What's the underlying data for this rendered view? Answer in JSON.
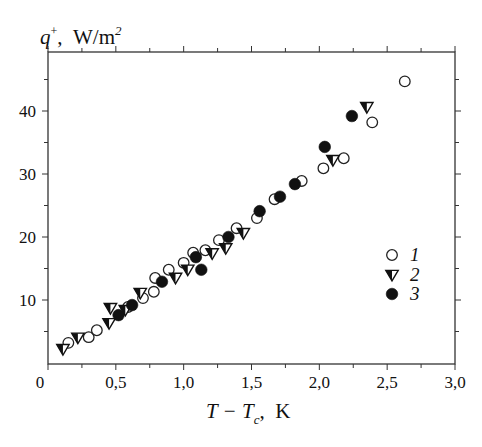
{
  "chart_data": {
    "type": "scatter",
    "title": "",
    "ylabel": {
      "main": "q",
      "sup": "+",
      "unit": "W/m",
      "unit_sup": "2"
    },
    "xlabel": {
      "main": "T − T",
      "sub": "c",
      "unit": "K"
    },
    "xlim": [
      0,
      3.0
    ],
    "ylim": [
      0,
      47
    ],
    "x_ticks": [
      0,
      0.5,
      1.0,
      1.5,
      2.0,
      2.5,
      3.0
    ],
    "x_tick_labels": [
      "0",
      "0,5",
      "1,0",
      "1,5",
      "2,0",
      "2,5",
      "3,0"
    ],
    "x_minor_step": 0.25,
    "y_ticks": [
      10,
      20,
      30,
      40
    ],
    "y_tick_labels": [
      "10",
      "20",
      "30",
      "40"
    ],
    "y_minor_step": 5,
    "grid": false,
    "legend_position": "right",
    "series": [
      {
        "name": "1",
        "marker": "open-circle",
        "points": [
          [
            0.15,
            3.2
          ],
          [
            0.3,
            4.1
          ],
          [
            0.36,
            5.2
          ],
          [
            0.59,
            8.9
          ],
          [
            0.7,
            10.3
          ],
          [
            0.78,
            11.3
          ],
          [
            0.79,
            13.5
          ],
          [
            0.89,
            14.8
          ],
          [
            1.0,
            15.9
          ],
          [
            1.07,
            17.5
          ],
          [
            1.16,
            17.9
          ],
          [
            1.26,
            19.5
          ],
          [
            1.39,
            21.4
          ],
          [
            1.54,
            23.0
          ],
          [
            1.67,
            26.0
          ],
          [
            1.87,
            28.9
          ],
          [
            2.03,
            30.9
          ],
          [
            2.18,
            32.5
          ],
          [
            2.39,
            38.2
          ],
          [
            2.63,
            44.7
          ]
        ]
      },
      {
        "name": "2",
        "marker": "half-filled-down-triangle",
        "points": [
          [
            0.11,
            2.2
          ],
          [
            0.22,
            4.0
          ],
          [
            0.45,
            6.3
          ],
          [
            0.46,
            8.7
          ],
          [
            0.57,
            8.4
          ],
          [
            0.68,
            11.1
          ],
          [
            0.94,
            13.5
          ],
          [
            1.03,
            14.8
          ],
          [
            1.21,
            17.4
          ],
          [
            1.31,
            18.2
          ],
          [
            1.44,
            20.6
          ],
          [
            2.1,
            32.2
          ],
          [
            2.35,
            40.6
          ]
        ]
      },
      {
        "name": "3",
        "marker": "filled-circle",
        "points": [
          [
            0.52,
            7.6
          ],
          [
            0.62,
            9.2
          ],
          [
            0.84,
            12.9
          ],
          [
            1.09,
            16.8
          ],
          [
            1.13,
            14.8
          ],
          [
            1.33,
            20.0
          ],
          [
            1.56,
            24.1
          ],
          [
            1.71,
            26.4
          ],
          [
            1.82,
            28.4
          ],
          [
            2.04,
            34.3
          ],
          [
            2.24,
            39.2
          ]
        ]
      }
    ],
    "legend": [
      {
        "label": "1",
        "marker": "open-circle"
      },
      {
        "label": "2",
        "marker": "half-filled-down-triangle"
      },
      {
        "label": "3",
        "marker": "filled-circle"
      }
    ]
  }
}
